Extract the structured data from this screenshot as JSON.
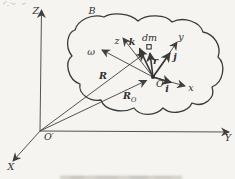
{
  "figure": {
    "labels": {
      "body": "B",
      "inertial_origin": "O′",
      "axis_X": "X",
      "axis_Y": "Y",
      "axis_Z": "Z",
      "body_origin": "O",
      "axis_x": "x",
      "axis_y": "y",
      "axis_z": "z",
      "unit_i": "i",
      "unit_j": "j",
      "unit_k": "k",
      "mass_element": "dm",
      "vector_r": "r",
      "vector_R": "R",
      "vector_RO_main": "R",
      "vector_RO_sub": "O",
      "angular_velocity": "ω"
    },
    "colors": {
      "ink": "#3f3f3f",
      "text": "#2f2f2f",
      "paper": "#f5f4f0"
    }
  }
}
